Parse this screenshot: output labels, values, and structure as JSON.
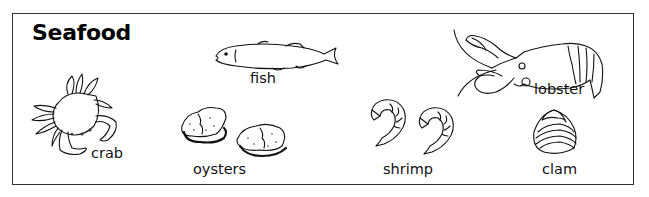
{
  "title": "Seafood",
  "items": [
    {
      "id": "crab",
      "label": "crab"
    },
    {
      "id": "fish",
      "label": "fish"
    },
    {
      "id": "oysters",
      "label": "oysters"
    },
    {
      "id": "shrimp",
      "label": "shrimp"
    },
    {
      "id": "lobster",
      "label": "lobster"
    },
    {
      "id": "clam",
      "label": "clam"
    }
  ],
  "colors": {
    "line": "#111111",
    "border": "#333333",
    "background": "#ffffff"
  }
}
